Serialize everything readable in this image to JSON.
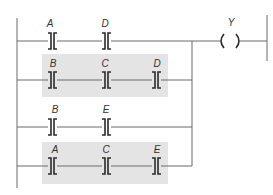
{
  "diagram": {
    "type": "ladder-logic",
    "colors": {
      "wire": "#6b6b6b",
      "symbol": "#2a2a2a",
      "highlight": "#e4e4e4",
      "background": "#ffffff"
    },
    "output": {
      "label": "Y",
      "symbol": "coil"
    },
    "rungs": [
      {
        "id": "rung-1",
        "highlighted": false,
        "contacts": [
          {
            "label": "A"
          },
          {
            "label": "D"
          }
        ]
      },
      {
        "id": "rung-2",
        "highlighted": true,
        "contacts": [
          {
            "label": "B"
          },
          {
            "label": "C"
          },
          {
            "label": "D"
          }
        ]
      },
      {
        "id": "rung-3",
        "highlighted": false,
        "contacts": [
          {
            "label": "B"
          },
          {
            "label": "E"
          }
        ]
      },
      {
        "id": "rung-4",
        "highlighted": true,
        "contacts": [
          {
            "label": "A"
          },
          {
            "label": "C"
          },
          {
            "label": "E"
          }
        ]
      }
    ]
  }
}
